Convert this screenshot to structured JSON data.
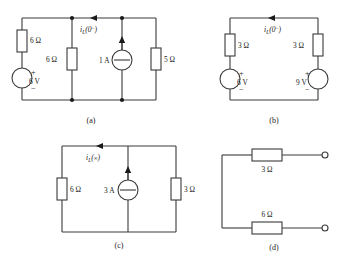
{
  "figure": {
    "type": "circuit-diagram-set",
    "background": "#ffffff",
    "ink": "#3a3a3a",
    "subfigures": [
      {
        "id": "a",
        "caption": "(a)",
        "current_label": {
          "symbol": "i",
          "subscript": "L",
          "argument": "(0",
          "argument_sup": "−",
          "argument_close": ")",
          "full": "iL(0-)"
        },
        "current_direction": "left",
        "components": [
          {
            "name": "resistor-6ohm-left",
            "value": "6",
            "unit": "Ω",
            "label": "6 Ω",
            "orientation": "vertical"
          },
          {
            "name": "source-6v",
            "value": "6",
            "unit": "V",
            "label": "6 V",
            "kind": "voltage",
            "plus": "+",
            "minus": "−"
          },
          {
            "name": "resistor-6ohm-mid",
            "value": "6",
            "unit": "Ω",
            "label": "6 Ω",
            "orientation": "vertical"
          },
          {
            "name": "source-1a",
            "value": "1",
            "unit": "A",
            "label": "1 A",
            "kind": "current",
            "direction": "up"
          },
          {
            "name": "resistor-5ohm",
            "value": "5",
            "unit": "Ω",
            "label": "5 Ω",
            "orientation": "vertical"
          }
        ]
      },
      {
        "id": "b",
        "caption": "(b)",
        "current_label": {
          "symbol": "i",
          "subscript": "L",
          "argument": "(0",
          "argument_sup": "−",
          "argument_close": ")",
          "full": "iL(0-)"
        },
        "current_direction": "left",
        "components": [
          {
            "name": "resistor-3ohm-left",
            "value": "3",
            "unit": "Ω",
            "label": "3 Ω",
            "orientation": "vertical"
          },
          {
            "name": "source-6v",
            "value": "6",
            "unit": "V",
            "label": "6 V",
            "kind": "voltage",
            "plus": "+",
            "minus": "−"
          },
          {
            "name": "resistor-3ohm-right",
            "value": "3",
            "unit": "Ω",
            "label": "3 Ω",
            "orientation": "vertical"
          },
          {
            "name": "source-9v",
            "value": "9",
            "unit": "V",
            "label": "9 V",
            "kind": "voltage",
            "plus": "+",
            "minus": "−"
          }
        ]
      },
      {
        "id": "c",
        "caption": "(c)",
        "current_label": {
          "symbol": "i",
          "subscript": "L",
          "argument": "(",
          "argument_sup": "∞",
          "argument_close": ")",
          "full": "iL(∞)"
        },
        "current_direction": "left",
        "components": [
          {
            "name": "resistor-6ohm",
            "value": "6",
            "unit": "Ω",
            "label": "6 Ω",
            "orientation": "vertical"
          },
          {
            "name": "source-3a",
            "value": "3",
            "unit": "A",
            "label": "3 A",
            "kind": "current",
            "direction": "up"
          },
          {
            "name": "resistor-3ohm",
            "value": "3",
            "unit": "Ω",
            "label": "3 Ω",
            "orientation": "vertical"
          }
        ]
      },
      {
        "id": "d",
        "caption": "(d)",
        "components": [
          {
            "name": "resistor-3ohm-top",
            "value": "3",
            "unit": "Ω",
            "label": "3 Ω",
            "orientation": "horizontal"
          },
          {
            "name": "resistor-6ohm-bottom",
            "value": "6",
            "unit": "Ω",
            "label": "6 Ω",
            "orientation": "horizontal"
          }
        ],
        "terminals": [
          {
            "name": "terminal-top",
            "type": "open"
          },
          {
            "name": "terminal-bottom",
            "type": "open"
          }
        ]
      }
    ]
  }
}
